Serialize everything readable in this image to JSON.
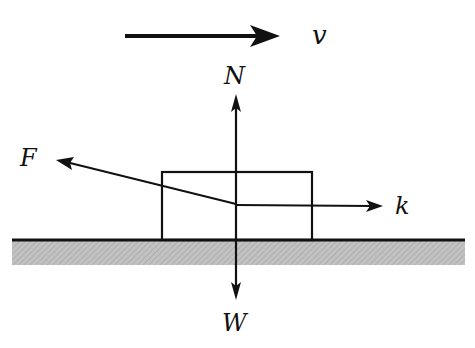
{
  "diagram": {
    "type": "free-body diagram",
    "labels": {
      "velocity": "v",
      "normal": "N",
      "applied": "F",
      "friction": "k",
      "weight": "W"
    },
    "colors": {
      "line": "#111111",
      "ground_fill": "#b8b8b8",
      "background": "#ffffff"
    }
  }
}
